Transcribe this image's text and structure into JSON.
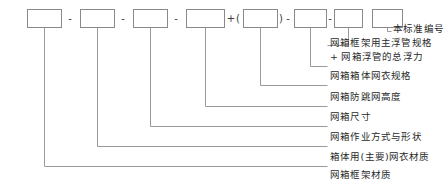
{
  "diagram": {
    "colors": {
      "box_stroke": "#8a8a8a",
      "leader_line": "#9a9a9a",
      "text": "#2a2a2a",
      "separator": "#3a3a3a",
      "background": "#ffffff"
    },
    "boxes": [
      {
        "id": "box-1",
        "value": "",
        "x": 27,
        "y": 9,
        "w": 34,
        "h": 18
      },
      {
        "id": "box-2",
        "value": "",
        "x": 80,
        "y": 9,
        "w": 34,
        "h": 18
      },
      {
        "id": "box-3",
        "value": "",
        "x": 133,
        "y": 9,
        "w": 34,
        "h": 18
      },
      {
        "id": "box-4",
        "value": "",
        "x": 186,
        "y": 9,
        "w": 38,
        "h": 18
      },
      {
        "id": "box-5",
        "value": "",
        "x": 243,
        "y": 9,
        "w": 34,
        "h": 18
      },
      {
        "id": "box-6",
        "value": "",
        "x": 294,
        "y": 9,
        "w": 32,
        "h": 18
      },
      {
        "id": "box-7",
        "value": "",
        "x": 334,
        "y": 9,
        "w": 28,
        "h": 18
      },
      {
        "id": "box-8",
        "value": "",
        "x": 372,
        "y": 9,
        "w": 30,
        "h": 18
      }
    ],
    "separators": [
      {
        "id": "sep-1",
        "text": "-",
        "x": 70,
        "y": 18
      },
      {
        "id": "sep-2",
        "text": "-",
        "x": 123,
        "y": 18
      },
      {
        "id": "sep-3",
        "text": "-",
        "x": 176,
        "y": 18
      },
      {
        "id": "sep-4",
        "text": "+",
        "x": 231,
        "y": 18
      },
      {
        "id": "paren-open",
        "text": "(",
        "x": 238,
        "y": 18
      },
      {
        "id": "paren-close",
        "text": ")",
        "x": 281,
        "y": 18
      },
      {
        "id": "sep-5",
        "text": "-",
        "x": 288,
        "y": 18
      },
      {
        "id": "sep-6",
        "text": "-",
        "x": 330,
        "y": 18
      }
    ],
    "labels": [
      {
        "id": "label-1",
        "text": "本标准编号",
        "source_box": "box-8",
        "text_x": 393,
        "text_y": 32
      },
      {
        "id": "label-2",
        "text": "网箱框架用主浮管规格",
        "source_box": "box-7",
        "text_x": 330,
        "text_y": 46
      },
      {
        "id": "label-3",
        "text": "+ 网箱浮管的总浮力",
        "source_box": "box-6",
        "text_x": 330,
        "text_y": 60
      },
      {
        "id": "label-4",
        "text": "网箱箱体网衣规格",
        "source_box": "box-6",
        "text_x": 330,
        "text_y": 79
      },
      {
        "id": "label-5",
        "text": "网箱防跳网高度",
        "source_box": "box-5",
        "text_x": 330,
        "text_y": 100
      },
      {
        "id": "label-6",
        "text": "网箱尺寸",
        "source_box": "box-4",
        "text_x": 330,
        "text_y": 120
      },
      {
        "id": "label-7",
        "text": "网箱作业方式与形状",
        "source_box": "box-3",
        "text_x": 330,
        "text_y": 140
      },
      {
        "id": "label-8",
        "text": "箱体用(主要)网衣材质",
        "source_box": "box-2",
        "text_x": 330,
        "text_y": 160
      },
      {
        "id": "label-9",
        "text": "网箱框架材质",
        "source_box": "box-1",
        "text_x": 330,
        "text_y": 178
      }
    ],
    "leaders": [
      {
        "id": "leader-1",
        "drop_x": 387,
        "elbow_y": 31,
        "end_x": 391
      },
      {
        "id": "leader-2",
        "drop_x": 348,
        "elbow_y": 45,
        "end_x": 327
      },
      {
        "id": "leader-3",
        "drop_x": 310,
        "elbow_y": 66,
        "end_x": 327
      },
      {
        "id": "leader-4",
        "drop_x": 260,
        "elbow_y": 85,
        "end_x": 327
      },
      {
        "id": "leader-5",
        "drop_x": 205,
        "elbow_y": 106,
        "end_x": 327
      },
      {
        "id": "leader-6",
        "drop_x": 150,
        "elbow_y": 126,
        "end_x": 327
      },
      {
        "id": "leader-7",
        "drop_x": 97,
        "elbow_y": 146,
        "end_x": 327
      },
      {
        "id": "leader-8",
        "drop_x": 44,
        "elbow_y": 166,
        "end_x": 327
      }
    ]
  }
}
